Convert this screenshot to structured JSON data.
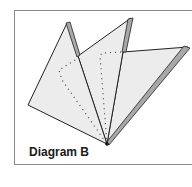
{
  "diagram": {
    "caption": "Diagram B",
    "colors": {
      "paper_fill": "#ececec",
      "edge_stroke": "#222222",
      "fold_strip": "#a8a8a8",
      "frame": "#8a8a8a",
      "dotted_line": "#444444"
    },
    "components": [
      "left-flap",
      "middle-flap",
      "right-flap",
      "dotted-fold-guides",
      "bottom-vertex"
    ]
  }
}
